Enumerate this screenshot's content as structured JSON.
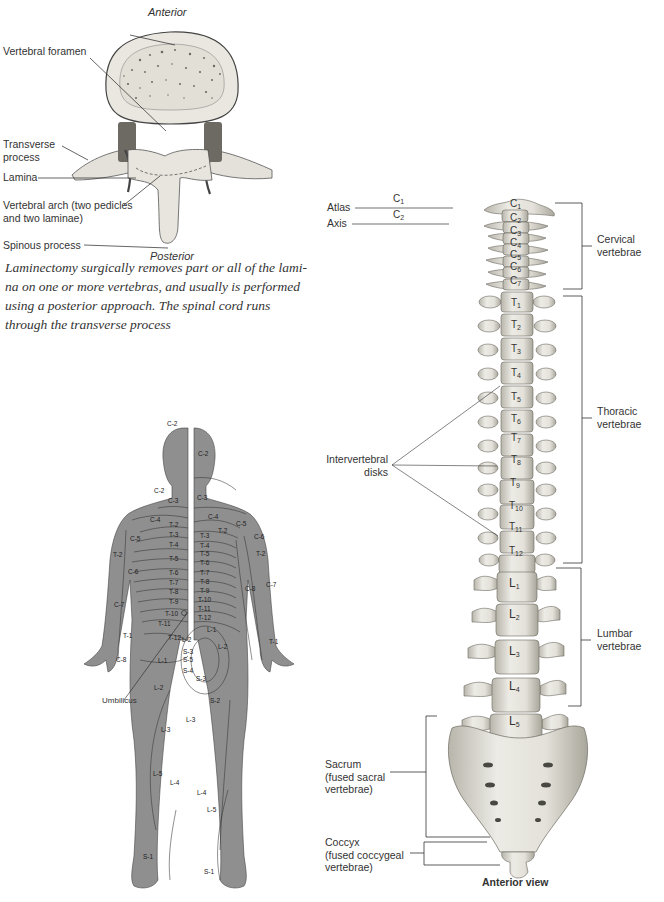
{
  "vertebra_figure": {
    "top_label": "Anterior",
    "bottom_label": "Posterior",
    "callouts": [
      {
        "id": "vertebral-foramen",
        "text": "Vertebral foramen"
      },
      {
        "id": "transverse-process",
        "lines": [
          "Transverse",
          "process"
        ]
      },
      {
        "id": "lamina",
        "text": "Lamina"
      },
      {
        "id": "vertebral-arch",
        "lines": [
          "Vertebral arch (two pedicles",
          "and two laminae)"
        ]
      },
      {
        "id": "spinous-process",
        "text": "Spinous process"
      }
    ],
    "caption_lines": [
      "Laminectomy surgically removes part or all of the lami-",
      "na on one or more vertebras, and usually is performed",
      "using a posterior approach. The spinal cord runs",
      "through the transverse process"
    ]
  },
  "dermatome_figure": {
    "umbilicus_label": "Umbilicus",
    "left_half_labels": [
      "C-2",
      "C-2",
      "C-3",
      "C-4",
      "C-5",
      "T-2",
      "T-3",
      "T-4",
      "T-5",
      "T-6",
      "T-7",
      "T-8",
      "T-9",
      "T-10",
      "T-11",
      "T-12",
      "T-2",
      "C-6",
      "C-7",
      "T-1",
      "C-8",
      "L-1",
      "L-2",
      "L-2",
      "S-3",
      "S-5",
      "S-4",
      "L-3",
      "L-5",
      "L-4",
      "S-1"
    ],
    "right_half_labels": [
      "C-2",
      "C-3",
      "C-4",
      "C-5",
      "C-6",
      "T-2",
      "T-3",
      "T-4",
      "T-5",
      "T-6",
      "T-7",
      "T-8",
      "T-9",
      "T-10",
      "T-11",
      "T-12",
      "L-1",
      "L-2",
      "T-2",
      "C-7",
      "C-8",
      "T-1",
      "S-3",
      "S-2",
      "L-3",
      "L-4",
      "L-5",
      "S-1"
    ]
  },
  "spine_figure": {
    "atlas_label": "Atlas",
    "axis_label": "Axis",
    "c1": {
      "letter": "C",
      "num": "1"
    },
    "c2": {
      "letter": "C",
      "num": "2"
    },
    "cervical": {
      "letter": "C",
      "nums": [
        "1",
        "2",
        "3",
        "4",
        "5",
        "6",
        "7"
      ]
    },
    "thoracic": {
      "letter": "T",
      "nums": [
        "1",
        "2",
        "3",
        "4",
        "5",
        "6",
        "7",
        "8",
        "9",
        "10",
        "11",
        "12"
      ]
    },
    "lumbar": {
      "letter": "L",
      "nums": [
        "1",
        "2",
        "3",
        "4",
        "5"
      ]
    },
    "regions": {
      "cervical": [
        "Cervical",
        "vertebrae"
      ],
      "thoracic": [
        "Thoracic",
        "vertebrae"
      ],
      "lumbar": [
        "Lumbar",
        "vertebrae"
      ],
      "sacrum": [
        "Sacrum",
        "(fused sacral",
        "vertebrae)"
      ],
      "coccyx": [
        "Coccyx",
        "(fused coccygeal",
        "vertebrae)"
      ]
    },
    "intervertebral_label": [
      "Intervertebral",
      "disks"
    ],
    "view_label": "Anterior view"
  },
  "colors": {
    "bone": "#e6e4dc",
    "bone_shade": "#9a978e",
    "skin": "#8f8f8f",
    "line": "#3a3a3a"
  }
}
